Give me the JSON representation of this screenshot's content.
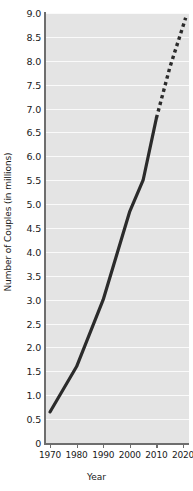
{
  "chart_data": {
    "type": "line",
    "title": "",
    "xlabel": "Year",
    "ylabel": "Number of Couples (in millions)",
    "xlim": [
      1970,
      2021
    ],
    "ylim": [
      0,
      9.0
    ],
    "grid": true,
    "legend": "none",
    "x_tick_labels": [
      "1970",
      "1980",
      "1990",
      "2000",
      "2010",
      "2020"
    ],
    "x_tick_values": [
      1970,
      1980,
      1990,
      2000,
      2010,
      2020
    ],
    "y_tick_labels": [
      "0",
      "0.5",
      "1.0",
      "1.5",
      "2.0",
      "2.5",
      "3.0",
      "3.5",
      "4.0",
      "4.5",
      "5.0",
      "5.5",
      "6.0",
      "6.5",
      "7.0",
      "7.5",
      "8.0",
      "8.5",
      "9.0"
    ],
    "y_tick_values": [
      0,
      0.5,
      1.0,
      1.5,
      2.0,
      2.5,
      3.0,
      3.5,
      4.0,
      4.5,
      5.0,
      5.5,
      6.0,
      6.5,
      7.0,
      7.5,
      8.0,
      8.5,
      9.0
    ],
    "series": [
      {
        "name": "Observed",
        "style": "solid",
        "color": "#2b2b2b",
        "x": [
          1970,
          1980,
          1990,
          2000,
          2005,
          2010
        ],
        "values": [
          0.65,
          1.6,
          3.0,
          4.85,
          5.5,
          6.8
        ]
      },
      {
        "name": "Projected",
        "style": "dotted",
        "color": "#2b2b2b",
        "x": [
          2010,
          2015,
          2021
        ],
        "values": [
          6.8,
          7.85,
          8.9
        ]
      }
    ]
  }
}
